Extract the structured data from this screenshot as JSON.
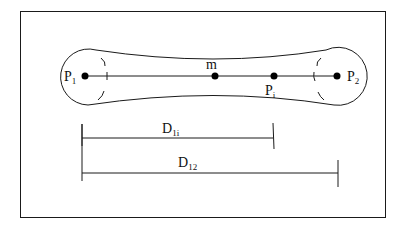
{
  "diagram": {
    "type": "geometric-schematic",
    "stroke_color": "#1a1a1a",
    "background": "#ffffff",
    "points": [
      {
        "id": "P1",
        "label": "P",
        "sub": "1",
        "x": 85,
        "y": 76
      },
      {
        "id": "m",
        "label": "m",
        "sub": "",
        "x": 215,
        "y": 76
      },
      {
        "id": "Pi",
        "label": "P",
        "sub": "i",
        "x": 274,
        "y": 76
      },
      {
        "id": "P2",
        "label": "P",
        "sub": "2",
        "x": 337,
        "y": 76
      }
    ],
    "labels": {
      "p1_main": "P",
      "p1_sub": "1",
      "m": "m",
      "pi_main": "P",
      "pi_sub": "i",
      "p2_main": "P",
      "p2_sub": "2",
      "d1i_main": "D",
      "d1i_sub": "1i",
      "d12_main": "D",
      "d12_sub": "12"
    },
    "dimensions": [
      {
        "id": "D1i",
        "from": "P1",
        "to": "Pi",
        "x1": 82,
        "x2": 273,
        "y": 138
      },
      {
        "id": "D12",
        "from": "P1",
        "to": "P2",
        "x1": 82,
        "x2": 338,
        "y": 173
      }
    ]
  }
}
